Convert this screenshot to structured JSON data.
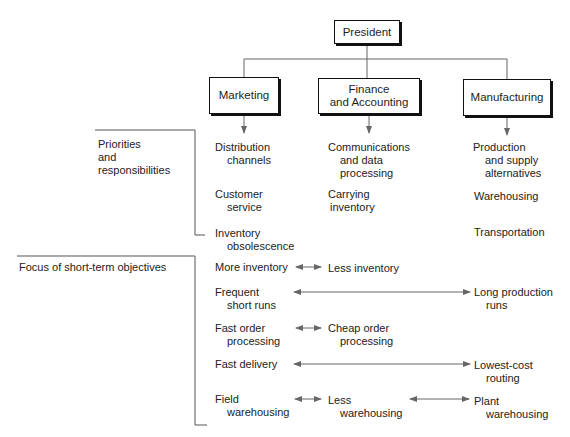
{
  "org": {
    "president": "President",
    "departments": [
      {
        "id": "marketing",
        "label": "Marketing"
      },
      {
        "id": "finance",
        "line1": "Finance",
        "line2": "and Accounting"
      },
      {
        "id": "manufacturing",
        "label": "Manufacturing"
      }
    ]
  },
  "sections": {
    "priorities_label": [
      "Priorities",
      "and",
      "responsibilities"
    ],
    "objectives_label": "Focus of short-term objectives"
  },
  "priorities": {
    "marketing": [
      [
        "Distribution",
        "channels"
      ],
      [
        "Customer",
        "service"
      ],
      [
        "Inventory",
        "obsolescence"
      ]
    ],
    "finance": [
      [
        "Communications",
        "and data",
        "processing"
      ],
      [
        "Carrying",
        "inventory"
      ]
    ],
    "manufacturing": [
      [
        "Production",
        "and supply",
        "alternatives"
      ],
      [
        "Warehousing"
      ],
      [
        "Transportation"
      ]
    ]
  },
  "objectives": [
    {
      "left": [
        "More inventory"
      ],
      "right": [
        "Less inventory"
      ]
    },
    {
      "left": [
        "Frequent",
        "short runs"
      ],
      "right": [
        "Long production",
        "runs"
      ]
    },
    {
      "left": [
        "Fast order",
        "processing"
      ],
      "right": [
        "Cheap order",
        "processing"
      ]
    },
    {
      "left": [
        "Fast delivery"
      ],
      "right": [
        "Lowest-cost",
        "routing"
      ]
    },
    {
      "left": [
        "Field",
        "warehousing"
      ],
      "middle": [
        "Less",
        "warehousing"
      ],
      "right": [
        "Plant",
        "warehousing"
      ]
    }
  ],
  "colors": {
    "line": "#555555",
    "arrow": "#666666",
    "border": "#111111"
  }
}
